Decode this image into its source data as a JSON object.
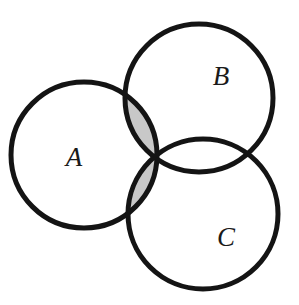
{
  "figure": {
    "kind": "venn-diagram",
    "background_color": "#ffffff",
    "stroke_color": "#141414",
    "stroke_width": 5,
    "shade_color": "#c8c8c8",
    "shaded_region_expression": "A ∩ (B ∪ C)",
    "width": 299,
    "height": 305
  },
  "sets": [
    {
      "id": "A",
      "label": "A",
      "cx": 84,
      "cy": 155,
      "r": 73,
      "label_x": 74,
      "label_y": 157,
      "label_size": 27
    },
    {
      "id": "B",
      "label": "B",
      "cx": 199,
      "cy": 98,
      "r": 74,
      "label_x": 221,
      "label_y": 76,
      "label_size": 27
    },
    {
      "id": "C",
      "label": "C",
      "cx": 203,
      "cy": 214,
      "r": 75,
      "label_x": 226,
      "label_y": 237,
      "label_size": 27
    }
  ],
  "chart_data": {
    "type": "diagram",
    "title": "",
    "subtitle": "",
    "xlabel": "",
    "ylabel": "",
    "diagram_type": "three-set Venn diagram",
    "set_labels": [
      "A",
      "B",
      "C"
    ],
    "circles": [
      {
        "set": "A",
        "cx": 84,
        "cy": 155,
        "r": 73
      },
      {
        "set": "B",
        "cx": 199,
        "cy": 98,
        "r": 74
      },
      {
        "set": "C",
        "cx": 203,
        "cy": 214,
        "r": 75
      }
    ],
    "regions": [
      {
        "name": "A only",
        "expression": "A \\ (B ∪ C)",
        "shaded": false,
        "fill": "#ffffff"
      },
      {
        "name": "B only",
        "expression": "B \\ (A ∪ C)",
        "shaded": false,
        "fill": "#ffffff"
      },
      {
        "name": "C only",
        "expression": "C \\ (A ∪ B)",
        "shaded": false,
        "fill": "#ffffff"
      },
      {
        "name": "A and B only",
        "expression": "(A ∩ B) \\ C",
        "shaded": true,
        "fill": "#c8c8c8"
      },
      {
        "name": "A and C only",
        "expression": "(A ∩ C) \\ B",
        "shaded": true,
        "fill": "#c8c8c8"
      },
      {
        "name": "B and C only",
        "expression": "(B ∩ C) \\ A",
        "shaded": false,
        "fill": "#ffffff"
      },
      {
        "name": "A and B and C",
        "expression": "A ∩ B ∩ C",
        "shaded": true,
        "fill": "#c8c8c8"
      }
    ],
    "shaded_expression": "A ∩ (B ∪ C)",
    "legend_position": "none",
    "grid": false
  }
}
